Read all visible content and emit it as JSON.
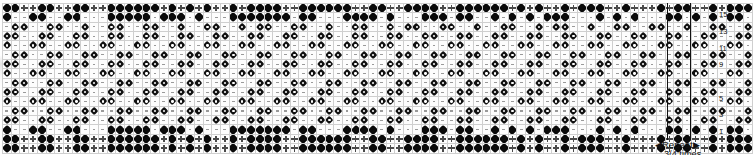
{
  "chart": {
    "columns": 86,
    "rows": 16,
    "symbols": {
      "d": "solid-diamond",
      "p": "plus-cross",
      "f": "flower-star",
      "s": "dash-tick",
      "b": "blank"
    },
    "row_numbers": [
      "",
      "15",
      "",
      "13",
      "",
      "11",
      "",
      "9",
      "",
      "7",
      "",
      "5",
      "",
      "3",
      "",
      "1"
    ],
    "row_number_values": [
      16,
      15,
      14,
      13,
      12,
      11,
      10,
      9,
      8,
      7,
      6,
      5,
      4,
      3,
      2,
      1
    ],
    "grid": [
      "ddppddppddppddddddpdpdpdppdpddddppddddddppddppddddppddddddpdpdppdpdddppdpppdpddppdpd",
      "dssddssddsssdddddsdddsdsssdddddddsddsssddddsdsssdddsddssdsdsdsdddsssdsdsdsssddsdsdsd",
      "sffssffssfssffssffssfssffssfsffssffssfssffssfsffssffssfssffssfsffssfssffssffssfssffs",
      "ffssffssffssffssffssffssffssffssffssffssffssffssffssffssffssffssffssffssffssffssffss",
      "fssffssffssffssffssffssffssffssffssffssffssffssffssffssffssffssffssffssffssffssffssf",
      "sffssffssffssffssffssffssffssffssffssffssffssffssffssffssffssffssffssffssffssffssffs",
      "ffssffssffssffssffssffssffssffssffssffssffssffssffssffssffssffssffssffssffssffssffss",
      "fssffssffssffssffssffssffssffssffssffssffssffssffssffssffssffssffssffssffssffssffssf",
      "sffssffssffssffssffssffssffssffssffssffssffssffssffssffssffssffssffssffssffssffssffs",
      "ffssffssffssffssffssffssffssffssffssffssffssffssffssffssffssffssffssffssffssffssffss",
      "fssffssffssffssffssffssffssffssffssffssffssffssffssffssffssffssffssffssffssffssffssf",
      "sffssffssffssffssffssffssffssffssffssffssffssffssffssffssffssffssffssffssffssffssffs",
      "ffssffssffssffssffssffssffssffssffssffssffssffssffssffssffssffssffssffssffssffssffss",
      "dssddssddsssdddddsdddsdsssdddddddsddsssddddsdsssdddsddssdsdsdsdddsssdsdsdsssddsdsdsd",
      "ddppddppddppddddddpdpdpdppdpddddppddddddppddppddddppddddddpdpdppdpdddppdpppdpddppdpd",
      "ddppddppddppddddddpdpdpdppdpddddppddddddppddppddddppddddddpdpdppdpdddppdpppdpddppdpd"
    ]
  },
  "repeat": {
    "left_arrow": "◀",
    "right_arrow": "▶",
    "label": "Repeat",
    "sub_label": "3/4 times"
  }
}
